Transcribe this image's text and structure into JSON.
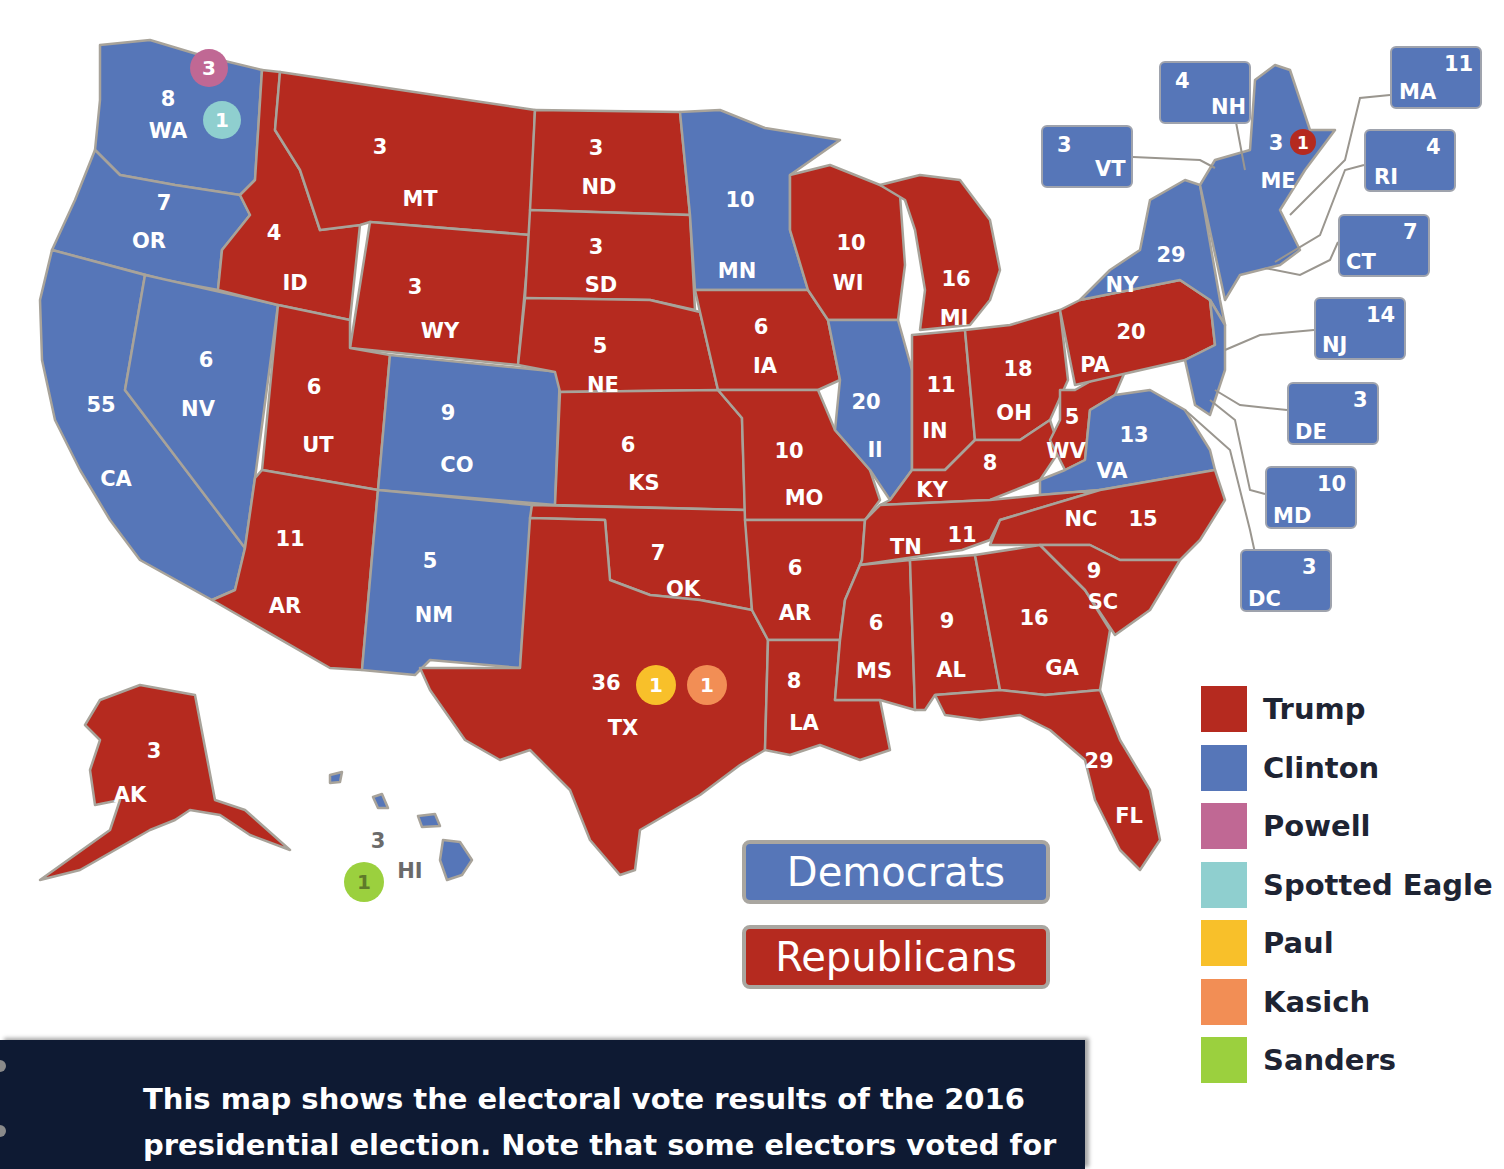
{
  "heading_fragment": "ɟɟɟ ɕɕɕɕ",
  "colors": {
    "trump": "#b52a1f",
    "clinton": "#5676b8",
    "powell": "#c06894",
    "spotted_eagle": "#8fcfcf",
    "paul": "#f8c02a",
    "kasich": "#f28e55",
    "sanders": "#9bd03e",
    "caption_bg": "#0e1a33"
  },
  "states": {
    "WA": {
      "abbr": "WA",
      "votes": "8",
      "party": "Clinton"
    },
    "OR": {
      "abbr": "OR",
      "votes": "7",
      "party": "Clinton"
    },
    "CA": {
      "abbr": "CA",
      "votes": "55",
      "party": "Clinton"
    },
    "NV": {
      "abbr": "NV",
      "votes": "6",
      "party": "Clinton"
    },
    "ID": {
      "abbr": "ID",
      "votes": "4",
      "party": "Trump"
    },
    "MT": {
      "abbr": "MT",
      "votes": "3",
      "party": "Trump"
    },
    "WY": {
      "abbr": "WY",
      "votes": "3",
      "party": "Trump"
    },
    "UT": {
      "abbr": "UT",
      "votes": "6",
      "party": "Trump"
    },
    "CO": {
      "abbr": "CO",
      "votes": "9",
      "party": "Clinton"
    },
    "AZ": {
      "abbr": "AR",
      "votes": "11",
      "party": "Trump"
    },
    "NM": {
      "abbr": "NM",
      "votes": "5",
      "party": "Clinton"
    },
    "ND": {
      "abbr": "ND",
      "votes": "3",
      "party": "Trump"
    },
    "SD": {
      "abbr": "SD",
      "votes": "3",
      "party": "Trump"
    },
    "NE": {
      "abbr": "NE",
      "votes": "5",
      "party": "Trump"
    },
    "KS": {
      "abbr": "KS",
      "votes": "6",
      "party": "Trump"
    },
    "OK": {
      "abbr": "OK",
      "votes": "7",
      "party": "Trump"
    },
    "TX": {
      "abbr": "TX",
      "votes": "36",
      "party": "Trump"
    },
    "MN": {
      "abbr": "MN",
      "votes": "10",
      "party": "Clinton"
    },
    "IA": {
      "abbr": "IA",
      "votes": "6",
      "party": "Trump"
    },
    "MO": {
      "abbr": "MO",
      "votes": "10",
      "party": "Trump"
    },
    "AR": {
      "abbr": "AR",
      "votes": "6",
      "party": "Trump"
    },
    "LA": {
      "abbr": "LA",
      "votes": "8",
      "party": "Trump"
    },
    "WI": {
      "abbr": "WI",
      "votes": "10",
      "party": "Trump"
    },
    "IL": {
      "abbr": "Il",
      "votes": "20",
      "party": "Clinton"
    },
    "MI": {
      "abbr": "MI",
      "votes": "16",
      "party": "Trump"
    },
    "IN": {
      "abbr": "IN",
      "votes": "11",
      "party": "Trump"
    },
    "OH": {
      "abbr": "OH",
      "votes": "18",
      "party": "Trump"
    },
    "KY": {
      "abbr": "KY",
      "votes": "8",
      "party": "Trump"
    },
    "TN": {
      "abbr": "TN",
      "votes": "11",
      "party": "Trump"
    },
    "MS": {
      "abbr": "MS",
      "votes": "6",
      "party": "Trump"
    },
    "AL": {
      "abbr": "AL",
      "votes": "9",
      "party": "Trump"
    },
    "GA": {
      "abbr": "GA",
      "votes": "16",
      "party": "Trump"
    },
    "FL": {
      "abbr": "FL",
      "votes": "29",
      "party": "Trump"
    },
    "SC": {
      "abbr": "SC",
      "votes": "9",
      "party": "Trump"
    },
    "NC": {
      "abbr": "NC",
      "votes": "15",
      "party": "Trump"
    },
    "WV": {
      "abbr": "WV",
      "votes": "5",
      "party": "Trump"
    },
    "VA": {
      "abbr": "VA",
      "votes": "13",
      "party": "Clinton"
    },
    "PA": {
      "abbr": "PA",
      "votes": "20",
      "party": "Trump"
    },
    "NY": {
      "abbr": "NY",
      "votes": "29",
      "party": "Clinton"
    },
    "ME": {
      "abbr": "ME",
      "votes": "3",
      "party": "Clinton"
    },
    "AK": {
      "abbr": "AK",
      "votes": "3",
      "party": "Trump"
    },
    "HI": {
      "abbr": "HI",
      "votes": "3",
      "party": "Clinton"
    }
  },
  "faithless_badges": {
    "wa_powell": {
      "value": "3",
      "candidate": "Powell"
    },
    "wa_spotted_eagle": {
      "value": "1",
      "candidate": "Spotted Eagle"
    },
    "me_trump": {
      "value": "1",
      "candidate": "Trump"
    },
    "tx_paul": {
      "value": "1",
      "candidate": "Paul"
    },
    "tx_kasich": {
      "value": "1",
      "candidate": "Kasich"
    },
    "hi_sanders": {
      "value": "1",
      "candidate": "Sanders"
    }
  },
  "callouts": {
    "NH": {
      "abbr": "NH",
      "votes": "4"
    },
    "VT": {
      "abbr": "VT",
      "votes": "3"
    },
    "MA": {
      "abbr": "MA",
      "votes": "11"
    },
    "RI": {
      "abbr": "RI",
      "votes": "4"
    },
    "CT": {
      "abbr": "CT",
      "votes": "7"
    },
    "NJ": {
      "abbr": "NJ",
      "votes": "14"
    },
    "DE": {
      "abbr": "DE",
      "votes": "3"
    },
    "MD": {
      "abbr": "MD",
      "votes": "10"
    },
    "DC": {
      "abbr": "DC",
      "votes": "3"
    }
  },
  "party_labels": {
    "democrats": "Democrats",
    "republicans": "Republicans"
  },
  "legend": [
    {
      "label": "Trump",
      "color": "#b52a1f"
    },
    {
      "label": "Clinton",
      "color": "#5676b8"
    },
    {
      "label": "Powell",
      "color": "#c06894"
    },
    {
      "label": "Spotted Eagle",
      "color": "#8fcfcf"
    },
    {
      "label": "Paul",
      "color": "#f8c02a"
    },
    {
      "label": "Kasich",
      "color": "#f28e55"
    },
    {
      "label": "Sanders",
      "color": "#9bd03e"
    }
  ],
  "caption": "This map shows the electoral vote results of the 2016\npresidential election. Note that some electors voted for"
}
